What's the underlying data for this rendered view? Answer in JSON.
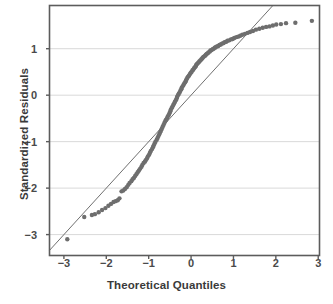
{
  "chart_data": {
    "type": "scatter",
    "title": "",
    "subtitle": "",
    "xlabel": "Theoretical Quantiles",
    "ylabel": "Standardized Residuals",
    "xlim": [
      -3.34,
      3.03
    ],
    "ylim": [
      -3.45,
      1.93
    ],
    "xticks": [
      -3,
      -2,
      -1,
      0,
      1,
      2,
      3
    ],
    "xticklabels": [
      "−3",
      "−2",
      "−1",
      "0",
      "1",
      "2",
      "3"
    ],
    "yticks": [
      1,
      0,
      -1,
      -2,
      -3
    ],
    "yticklabels": [
      "1",
      "0",
      "−1",
      "−2",
      "−3"
    ],
    "grid": "horizontal",
    "legend": "none",
    "annotations": [],
    "marker": {
      "shape": "circle",
      "size": 4.4,
      "color": "#6e6e6e"
    },
    "reference_line": {
      "label": "qq-reference-line",
      "color": "#707070",
      "width": 1,
      "slope": 1.0,
      "intercept": 0.0,
      "x_start": -3.1,
      "y_start": -3.1,
      "x_end": 1.93,
      "y_end": 1.93
    },
    "points": [
      [
        -2.92,
        -3.1
      ],
      [
        -2.52,
        -2.62
      ],
      [
        -2.34,
        -2.58
      ],
      [
        -2.27,
        -2.56
      ],
      [
        -2.18,
        -2.52
      ],
      [
        -2.1,
        -2.47
      ],
      [
        -2.02,
        -2.43
      ],
      [
        -1.95,
        -2.38
      ],
      [
        -1.89,
        -2.34
      ],
      [
        -1.83,
        -2.3
      ],
      [
        -1.78,
        -2.28
      ],
      [
        -1.73,
        -2.26
      ],
      [
        -1.69,
        -2.22
      ],
      [
        -1.64,
        -2.07
      ],
      [
        -1.6,
        -2.05
      ],
      [
        -1.56,
        -2.02
      ],
      [
        -1.52,
        -1.98
      ],
      [
        -1.48,
        -1.93
      ],
      [
        -1.45,
        -1.89
      ],
      [
        -1.41,
        -1.85
      ],
      [
        -1.38,
        -1.81
      ],
      [
        -1.35,
        -1.78
      ],
      [
        -1.32,
        -1.74
      ],
      [
        -1.29,
        -1.7
      ],
      [
        -1.26,
        -1.66
      ],
      [
        -1.23,
        -1.62
      ],
      [
        -1.2,
        -1.58
      ],
      [
        -1.17,
        -1.54
      ],
      [
        -1.15,
        -1.5
      ],
      [
        -1.12,
        -1.46
      ],
      [
        -1.09,
        -1.43
      ],
      [
        -1.07,
        -1.4
      ],
      [
        -1.04,
        -1.36
      ],
      [
        -1.02,
        -1.32
      ],
      [
        -0.99,
        -1.28
      ],
      [
        -0.97,
        -1.24
      ],
      [
        -0.95,
        -1.2
      ],
      [
        -0.92,
        -1.16
      ],
      [
        -0.9,
        -1.12
      ],
      [
        -0.88,
        -1.08
      ],
      [
        -0.86,
        -1.04
      ],
      [
        -0.84,
        -1.0
      ],
      [
        -0.81,
        -0.96
      ],
      [
        -0.79,
        -0.92
      ],
      [
        -0.77,
        -0.88
      ],
      [
        -0.75,
        -0.84
      ],
      [
        -0.73,
        -0.8
      ],
      [
        -0.71,
        -0.76
      ],
      [
        -0.69,
        -0.72
      ],
      [
        -0.67,
        -0.68
      ],
      [
        -0.65,
        -0.64
      ],
      [
        -0.63,
        -0.6
      ],
      [
        -0.61,
        -0.56
      ],
      [
        -0.59,
        -0.53
      ],
      [
        -0.57,
        -0.5
      ],
      [
        -0.55,
        -0.46
      ],
      [
        -0.53,
        -0.43
      ],
      [
        -0.51,
        -0.39
      ],
      [
        -0.49,
        -0.35
      ],
      [
        -0.48,
        -0.32
      ],
      [
        -0.46,
        -0.28
      ],
      [
        -0.44,
        -0.25
      ],
      [
        -0.42,
        -0.21
      ],
      [
        -0.4,
        -0.18
      ],
      [
        -0.38,
        -0.14
      ],
      [
        -0.36,
        -0.11
      ],
      [
        -0.34,
        -0.07
      ],
      [
        -0.33,
        -0.04
      ],
      [
        -0.31,
        0.0
      ],
      [
        -0.29,
        0.03
      ],
      [
        -0.27,
        0.06
      ],
      [
        -0.25,
        0.1
      ],
      [
        -0.23,
        0.13
      ],
      [
        -0.22,
        0.16
      ],
      [
        -0.2,
        0.19
      ],
      [
        -0.18,
        0.22
      ],
      [
        -0.16,
        0.25
      ],
      [
        -0.14,
        0.28
      ],
      [
        -0.12,
        0.31
      ],
      [
        -0.11,
        0.34
      ],
      [
        -0.09,
        0.37
      ],
      [
        -0.07,
        0.4
      ],
      [
        -0.05,
        0.42
      ],
      [
        -0.03,
        0.45
      ],
      [
        -0.01,
        0.48
      ],
      [
        0.01,
        0.5
      ],
      [
        0.03,
        0.53
      ],
      [
        0.05,
        0.55
      ],
      [
        0.07,
        0.58
      ],
      [
        0.09,
        0.6
      ],
      [
        0.11,
        0.62
      ],
      [
        0.12,
        0.65
      ],
      [
        0.14,
        0.67
      ],
      [
        0.16,
        0.69
      ],
      [
        0.18,
        0.71
      ],
      [
        0.2,
        0.73
      ],
      [
        0.22,
        0.75
      ],
      [
        0.24,
        0.77
      ],
      [
        0.26,
        0.79
      ],
      [
        0.28,
        0.81
      ],
      [
        0.3,
        0.83
      ],
      [
        0.33,
        0.85
      ],
      [
        0.35,
        0.87
      ],
      [
        0.37,
        0.89
      ],
      [
        0.39,
        0.9
      ],
      [
        0.41,
        0.92
      ],
      [
        0.44,
        0.94
      ],
      [
        0.46,
        0.96
      ],
      [
        0.48,
        0.97
      ],
      [
        0.51,
        0.99
      ],
      [
        0.53,
        1.0
      ],
      [
        0.56,
        1.02
      ],
      [
        0.58,
        1.03
      ],
      [
        0.61,
        1.05
      ],
      [
        0.64,
        1.06
      ],
      [
        0.67,
        1.08
      ],
      [
        0.7,
        1.09
      ],
      [
        0.73,
        1.11
      ],
      [
        0.76,
        1.12
      ],
      [
        0.79,
        1.14
      ],
      [
        0.83,
        1.15
      ],
      [
        0.86,
        1.17
      ],
      [
        0.9,
        1.18
      ],
      [
        0.94,
        1.2
      ],
      [
        0.98,
        1.21
      ],
      [
        1.02,
        1.23
      ],
      [
        1.07,
        1.25
      ],
      [
        1.11,
        1.26
      ],
      [
        1.16,
        1.28
      ],
      [
        1.21,
        1.3
      ],
      [
        1.27,
        1.32
      ],
      [
        1.33,
        1.34
      ],
      [
        1.39,
        1.36
      ],
      [
        1.46,
        1.38
      ],
      [
        1.53,
        1.41
      ],
      [
        1.61,
        1.43
      ],
      [
        1.69,
        1.45
      ],
      [
        1.77,
        1.47
      ],
      [
        1.85,
        1.48
      ],
      [
        1.93,
        1.5
      ],
      [
        2.01,
        1.52
      ],
      [
        2.12,
        1.53
      ],
      [
        2.24,
        1.55
      ],
      [
        2.46,
        1.56
      ],
      [
        2.85,
        1.6
      ]
    ]
  }
}
